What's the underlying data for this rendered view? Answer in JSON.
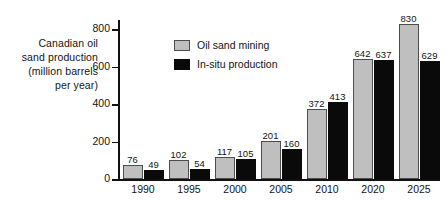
{
  "chart_data": {
    "type": "bar",
    "title": "",
    "xlabel": "",
    "ylabel": "Canadian oil sand production (million barrels per year)",
    "ylabel_lines": [
      "Canadian oil",
      "sand production",
      "(million barrels",
      "per year)"
    ],
    "categories": [
      "1990",
      "1995",
      "2000",
      "2005",
      "2010",
      "2020",
      "2025"
    ],
    "series": [
      {
        "name": "Oil sand mining",
        "color": "#bfbfbf",
        "values": [
          76,
          102,
          117,
          201,
          372,
          642,
          830
        ]
      },
      {
        "name": "In-situ production",
        "color": "#0a0a0a",
        "values": [
          49,
          54,
          105,
          160,
          413,
          637,
          629
        ]
      }
    ],
    "ylim": [
      0,
      850
    ],
    "yticks": [
      0,
      200,
      400,
      600,
      800
    ],
    "ytick_labels": [
      "0",
      "200",
      "400",
      "600",
      "800"
    ],
    "grid": false,
    "legend_position": "upper-left-inside",
    "legend": [
      {
        "label": "Oil sand mining",
        "swatch": "gray"
      },
      {
        "label": "In-situ production",
        "swatch": "black"
      }
    ]
  }
}
